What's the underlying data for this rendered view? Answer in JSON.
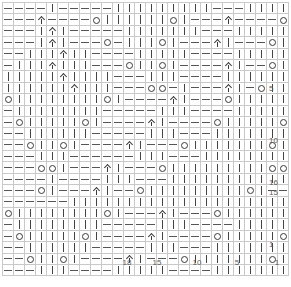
{
  "chart": {
    "kind": "knitting-stitch-chart",
    "columns": 26,
    "rows": 24,
    "cell_width_px": 10,
    "cell_height_px": 10.4,
    "grid_color": "#c9c9c9",
    "border_color": "#8a8a8a",
    "symbol_color": "#3a3a3a"
  },
  "legend": {
    "knit": "|",
    "purl": "—",
    "yarn_over": "O",
    "centered_double_decrease": "∧",
    "decrease": "λ"
  },
  "row_labels": [
    {
      "text": "16",
      "row_index": 17
    },
    {
      "text": "15",
      "row_index": 18
    },
    {
      "text": "10",
      "row_index": 13
    },
    {
      "text": "5",
      "row_index": 8
    },
    {
      "text": "1",
      "row_index": 23
    }
  ],
  "column_labels": [
    {
      "text": "18",
      "col_index": 12
    },
    {
      "text": "15",
      "col_index": 15
    },
    {
      "text": "10",
      "col_index": 19
    },
    {
      "text": "5",
      "col_index": 23
    },
    {
      "text": "1",
      "col_index": 27
    }
  ],
  "chart_data": {
    "type": "heatmap",
    "xlabel": "",
    "ylabel": "",
    "symbol_codes": {
      "k": "knit",
      "p": "purl",
      "o": "yarn-over",
      "a": "centered-double-decrease",
      "d": "decrease",
      ".": "blank"
    },
    "grid": [
      "ppppkpppppkkkkkkkkkpppkkkk.",
      "pppappppokkkkkkokpppappppok",
      "pppkakpppppkkkkkkkpppkkkkkd",
      "pppkakpppopkkkokpppakpppokk",
      "ppkkkakkppppkkkkkppppkkkkkd",
      "pkkkakkkpppokkokppppakppokk",
      "kkkkkakkkkpppkkkppppkkkkkkd",
      "kkkkkkakkkpppoopkpppakpokkk",
      "okkkkkkkkokppppakpppokkkkkk",
      "pkkkkkkkkpppppkkkppppkkkkkk",
      "pokkkkkokppppakppppokkkkkok",
      "ppkkkkkkpppppkkkpppkkkkkkkk",
      "ppokkokppppakpppokkkkkkkokk",
      "pppkkkppppppkkkpppkkkkkkkkk",
      "pppookpppakpppokkkkkkkkkook",
      "ppppkppppkkkpppkkkkkkkkkkkk",
      "pppokpppakppokkkkkkkkkokppk",
      "ppppppkkkkkkkkkkkkkkkkkkkkk",
      "okkkkkkkkokpppakpppokkkkkkd",
      "pkkkkkkkkpppppkkkppppkkkkkk",
      "pokkkkkokppppakppppokkkkkod",
      "ppkkkkkkpppppkkkpppkkkkkkkk",
      "ppokkokppppakpppokkkkkkkokd",
      "pppkkkppppkkkkkppppkkkkkkkd"
    ]
  }
}
